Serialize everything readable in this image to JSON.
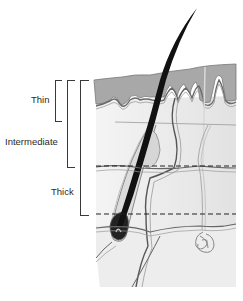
{
  "diagram": {
    "labels": {
      "thin": "Thin",
      "intermediate": "Intermediate",
      "thick": "Thick"
    },
    "levels": [
      {
        "name": "Thin",
        "bracket_top_y": 80,
        "bracket_bottom_y": 120
      },
      {
        "name": "Intermediate",
        "bracket_top_y": 80,
        "bracket_bottom_y": 166
      },
      {
        "name": "Thick",
        "bracket_top_y": 80,
        "bracket_bottom_y": 214
      }
    ],
    "colors": {
      "epidermis": "#a9a9a9",
      "dermis": "#ececec",
      "deep_dermis": "#e4e4e4",
      "subcutis": "#eeeeee",
      "hair": "#111111",
      "outline": "#555555",
      "background": "#ffffff"
    }
  }
}
